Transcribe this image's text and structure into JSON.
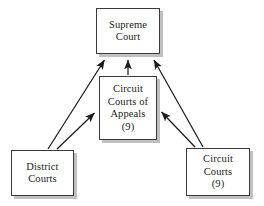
{
  "diagram": {
    "background_color": "#ffffff",
    "box_border_color": "#3a3a3a",
    "box_fill_color": "#ffffff",
    "text_color": "#1c1c1c",
    "arrow_color": "#1c1c1c",
    "shadow_color": "#8c8c8c",
    "nodes": [
      {
        "id": "supreme",
        "lines": [
          "Supreme",
          "Court"
        ],
        "line1": "Supreme",
        "line2": "Court",
        "line3": "",
        "line4": ""
      },
      {
        "id": "appeals",
        "lines": [
          "Circuit",
          "Courts of",
          "Appeals",
          "(9)"
        ],
        "line1": "Circuit",
        "line2": "Courts of",
        "line3": "Appeals",
        "line4": "(9)"
      },
      {
        "id": "district",
        "lines": [
          "District",
          "Courts"
        ],
        "line1": "District",
        "line2": "Courts",
        "line3": "",
        "line4": ""
      },
      {
        "id": "circuit",
        "lines": [
          "Circuit",
          "Courts",
          "(9)"
        ],
        "line1": "Circuit",
        "line2": "Courts",
        "line3": "(9)",
        "line4": ""
      }
    ],
    "edges": [
      {
        "id": "district-to-supreme",
        "from": "district",
        "to": "supreme",
        "direction": "up",
        "arrowhead": "end"
      },
      {
        "id": "district-to-appeals",
        "from": "district",
        "to": "appeals",
        "direction": "up-right",
        "arrowhead": "end"
      },
      {
        "id": "appeals-to-supreme",
        "from": "appeals",
        "to": "supreme",
        "direction": "up",
        "arrowhead": "end"
      },
      {
        "id": "circuit-to-supreme",
        "from": "circuit",
        "to": "supreme",
        "direction": "up",
        "arrowhead": "end"
      },
      {
        "id": "circuit-to-appeals",
        "from": "circuit",
        "to": "appeals",
        "direction": "up-left",
        "arrowhead": "end"
      }
    ]
  }
}
